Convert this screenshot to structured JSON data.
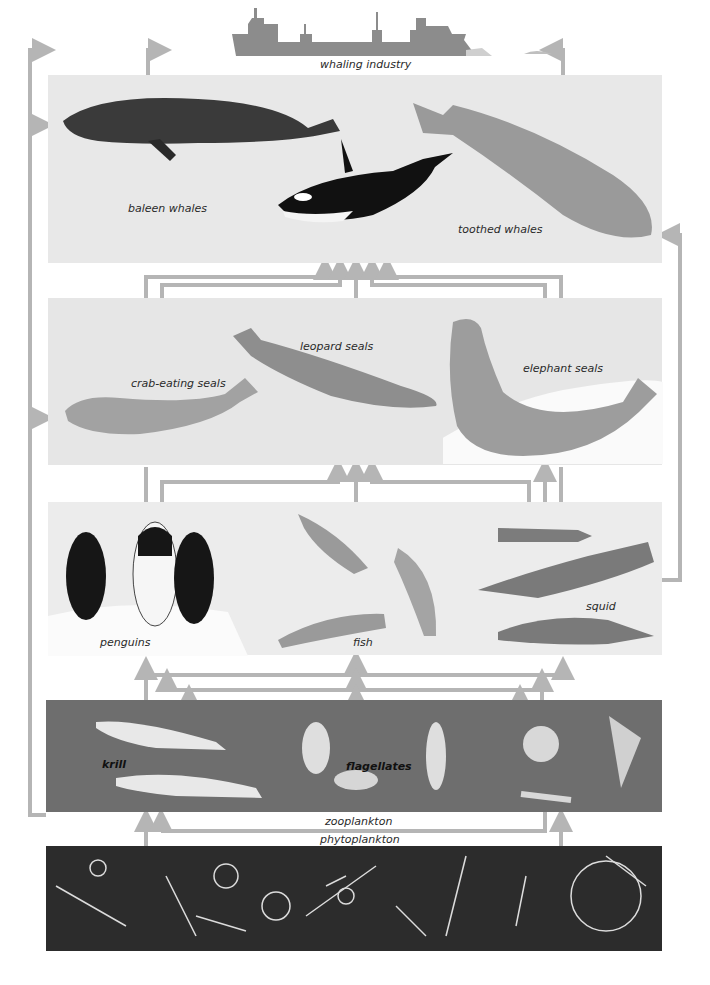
{
  "diagram": {
    "type": "food-web",
    "arrow_color": "#b5b5b5",
    "levels": [
      {
        "id": "whaling",
        "label": "whaling industry",
        "organisms": [
          "factory whaling ship"
        ],
        "background": "#ffffff"
      },
      {
        "id": "whales",
        "organisms": [
          {
            "name": "baleen whales",
            "label": "baleen whales"
          },
          {
            "name": "orca",
            "label": ""
          },
          {
            "name": "toothed whales",
            "label": "toothed whales"
          }
        ],
        "background": "#e8e8e8"
      },
      {
        "id": "seals",
        "organisms": [
          {
            "name": "crab-eating seals",
            "label": "crab-eating seals"
          },
          {
            "name": "leopard seals",
            "label": "leopard seals"
          },
          {
            "name": "elephant seals",
            "label": "elephant seals"
          }
        ],
        "background": "#e6e6e6"
      },
      {
        "id": "penguins-fish-squid",
        "organisms": [
          {
            "name": "penguins",
            "label": "penguins"
          },
          {
            "name": "fish",
            "label": "fish"
          },
          {
            "name": "squid",
            "label": "squid"
          }
        ],
        "background": "#ececec"
      },
      {
        "id": "zooplankton",
        "label": "zooplankton",
        "organisms": [
          {
            "name": "krill",
            "label": "krill"
          },
          {
            "name": "flagellates",
            "label": "flagellates"
          },
          {
            "name": "radiolarians",
            "label": ""
          }
        ],
        "background": "#6e6e6e"
      },
      {
        "id": "phytoplankton",
        "label": "phytoplankton",
        "organisms": [
          {
            "name": "diatoms",
            "label": ""
          }
        ],
        "background": "#2c2c2c"
      }
    ]
  },
  "labels": {
    "whaling_industry": "whaling industry",
    "baleen_whales": "baleen whales",
    "toothed_whales": "toothed whales",
    "crab_eating_seals": "crab-eating seals",
    "leopard_seals": "leopard seals",
    "elephant_seals": "elephant seals",
    "penguins": "penguins",
    "fish": "fish",
    "squid": "squid",
    "krill": "krill",
    "flagellates": "flagellates",
    "zooplankton": "zooplankton",
    "phytoplankton": "phytoplankton"
  }
}
